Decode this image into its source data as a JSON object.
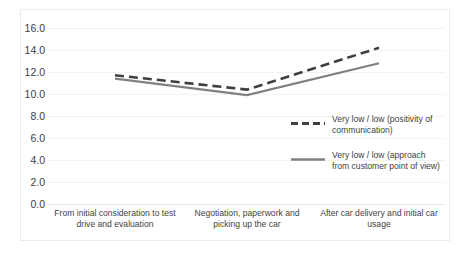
{
  "chart_data": {
    "type": "line",
    "title": "",
    "xlabel": "",
    "ylabel": "",
    "ylim": [
      0.0,
      16.0
    ],
    "y_ticks": [
      "0.0",
      "2.0",
      "4.0",
      "6.0",
      "8.0",
      "10.0",
      "12.0",
      "14.0",
      "16.0"
    ],
    "y_tick_values": [
      0.0,
      2.0,
      4.0,
      6.0,
      8.0,
      10.0,
      12.0,
      14.0,
      16.0
    ],
    "grid": true,
    "legend_position": "right-inside",
    "categories": [
      "From initial consideration to test drive and evaluation",
      "Negotiation, paperwork and picking up the car",
      "After car delivery and initial car usage"
    ],
    "series": [
      {
        "name": "Very low / low (positivity of communication)",
        "style": "dashed",
        "color": "#3f3f3f",
        "values": [
          11.7,
          10.4,
          14.2
        ]
      },
      {
        "name": "Very low / low (approach from customer point of view)",
        "style": "solid",
        "color": "#808080",
        "values": [
          11.4,
          9.9,
          12.8
        ]
      }
    ]
  },
  "legend": {
    "items": [
      {
        "label": "Very low / low (positivity of communication)",
        "swatch": "dashed-line-swatch"
      },
      {
        "label": "Very low / low (approach from customer point of view)",
        "swatch": "solid-line-swatch"
      }
    ]
  }
}
